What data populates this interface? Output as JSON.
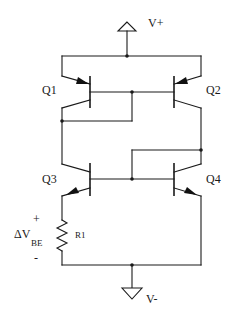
{
  "diagram": {
    "type": "circuit-schematic",
    "title": "",
    "supplies": {
      "positive": "V+",
      "negative": "V-"
    },
    "transistors": [
      {
        "id": "Q1",
        "label": "Q1",
        "type": "PNP",
        "side": "left"
      },
      {
        "id": "Q2",
        "label": "Q2",
        "type": "PNP",
        "side": "right"
      },
      {
        "id": "Q3",
        "label": "Q3",
        "type": "NPN",
        "side": "left"
      },
      {
        "id": "Q4",
        "label": "Q4",
        "type": "NPN",
        "side": "right"
      }
    ],
    "resistor": {
      "id": "R1",
      "label": "R1"
    },
    "voltage_annotation": {
      "plus": "+",
      "symbol": "ΔV",
      "subscript": "BE",
      "minus": "-"
    },
    "connections": [
      "V+ to emitters of Q1 and Q2",
      "Q1 base tied to Q2 base; Q1 diode-connected (base to collector)",
      "Q1 collector to Q3 collector",
      "Q2 collector to Q4 collector; Q4 diode-connected (collector to base)",
      "Q3 base tied to Q4 base",
      "Q3 emitter through R1 to V-",
      "Q4 emitter to V-"
    ]
  }
}
